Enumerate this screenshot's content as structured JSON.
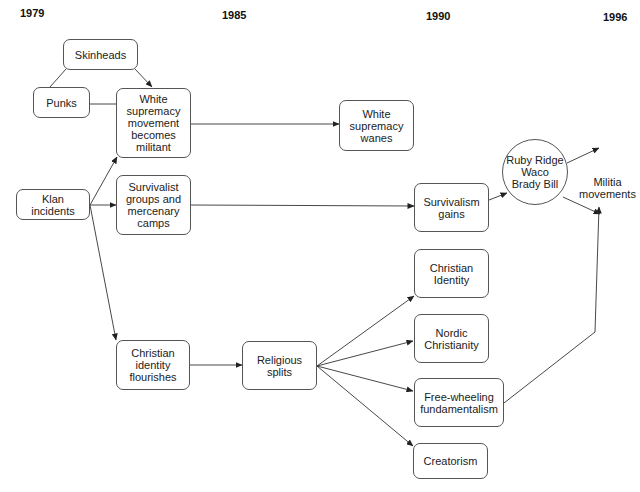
{
  "timeline": {
    "years": [
      "1979",
      "1985",
      "1990",
      "1996"
    ]
  },
  "nodes": {
    "skinheads": "Skinheads",
    "punks": "Punks",
    "white_supremacy_militant": "White\nsupremacy\nmovement\nbecomes\nmilitant",
    "white_supremacy_wanes": "White\nsupremacy\nwanes",
    "klan_incidents": "Klan\nincidents",
    "survivalist_groups": "Survivalist\ngroups and\nmercenary\ncamps",
    "survivalism_gains": "Survivalism\ngains",
    "events_circle": "Ruby Ridge\nWaco\nBrady Bill",
    "militia_movements": "Militia\nmovements",
    "christian_identity_flourishes": "Christian\nidentity\nflourishes",
    "religious_splits": "Religious\nsplits",
    "christian_identity": "Christian\nIdentity",
    "nordic_christianity": "Nordic\nChristianity",
    "free_wheeling": "Free-wheeling\nfundamentalism",
    "creatorism": "Creatorism"
  },
  "edges": [
    {
      "from": "skinheads",
      "to": "punks",
      "arrow": false
    },
    {
      "from": "skinheads",
      "to": "white_supremacy_militant",
      "arrow": true
    },
    {
      "from": "punks",
      "to": "white_supremacy_militant",
      "arrow": false
    },
    {
      "from": "klan_incidents",
      "to": "white_supremacy_militant",
      "arrow": true
    },
    {
      "from": "klan_incidents",
      "to": "survivalist_groups",
      "arrow": true
    },
    {
      "from": "klan_incidents",
      "to": "christian_identity_flourishes",
      "arrow": true
    },
    {
      "from": "white_supremacy_militant",
      "to": "white_supremacy_wanes",
      "arrow": true
    },
    {
      "from": "survivalist_groups",
      "to": "survivalism_gains",
      "arrow": true
    },
    {
      "from": "survivalism_gains",
      "to": "events_circle",
      "arrow": true
    },
    {
      "from": "events_circle",
      "to": "militia_movements",
      "arrow": true
    },
    {
      "from": "christian_identity_flourishes",
      "to": "religious_splits",
      "arrow": true
    },
    {
      "from": "religious_splits",
      "to": "christian_identity",
      "arrow": true
    },
    {
      "from": "religious_splits",
      "to": "nordic_christianity",
      "arrow": true
    },
    {
      "from": "religious_splits",
      "to": "free_wheeling",
      "arrow": true
    },
    {
      "from": "religious_splits",
      "to": "creatorism",
      "arrow": true
    },
    {
      "from": "free_wheeling",
      "to": "militia_movements",
      "arrow": true
    }
  ],
  "colors": {
    "line": "#333333",
    "border": "#555555",
    "background": "#ffffff"
  }
}
